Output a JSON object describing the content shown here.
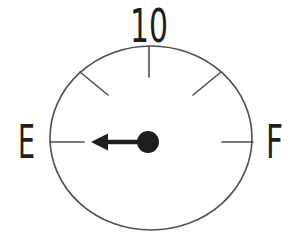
{
  "diagram": {
    "type": "fuel-gauge",
    "labels": {
      "top": "10",
      "left": "E",
      "right": "F"
    },
    "tick_count": 5,
    "needle_points_to": "E"
  },
  "colors": {
    "background": "#ffffff",
    "outline": "#4f4f4f",
    "ink": "#1e1e1e"
  }
}
